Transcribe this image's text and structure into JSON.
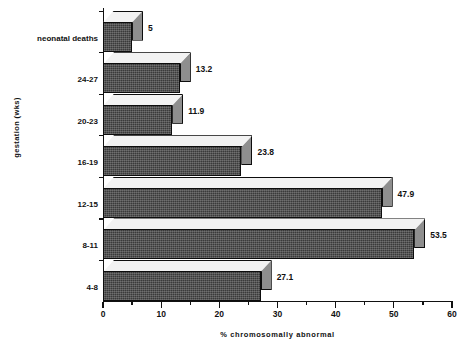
{
  "chart_data": {
    "type": "bar",
    "orientation": "horizontal",
    "style": "3d",
    "title": "",
    "xlabel": "% chromosomally abnormal",
    "ylabel": "gestation  (wks)",
    "categories": [
      "4-8",
      "8-11",
      "12-15",
      "16-19",
      "20-23",
      "24-27",
      "neonatal deaths"
    ],
    "values": [
      27.1,
      53.5,
      47.9,
      23.8,
      11.9,
      13.2,
      5
    ],
    "value_labels": [
      "27.1",
      "53.5",
      "47.9",
      "23.8",
      "11.9",
      "13.2",
      "5"
    ],
    "xlim": [
      0,
      60
    ],
    "xticks": [
      0,
      10,
      20,
      30,
      40,
      50,
      60
    ],
    "xtick_labels": [
      "0",
      "10",
      "20",
      "30",
      "40",
      "50",
      "60"
    ],
    "xminor_ticks": [
      5,
      15,
      25,
      35,
      45,
      55
    ],
    "grid": false,
    "legend": false,
    "colors": {
      "bar_front": "#3a3a3a",
      "bar_top": "#f2f2f2",
      "bar_side": "#8e8e8e",
      "axis": "#111111",
      "background": "#ffffff"
    }
  }
}
